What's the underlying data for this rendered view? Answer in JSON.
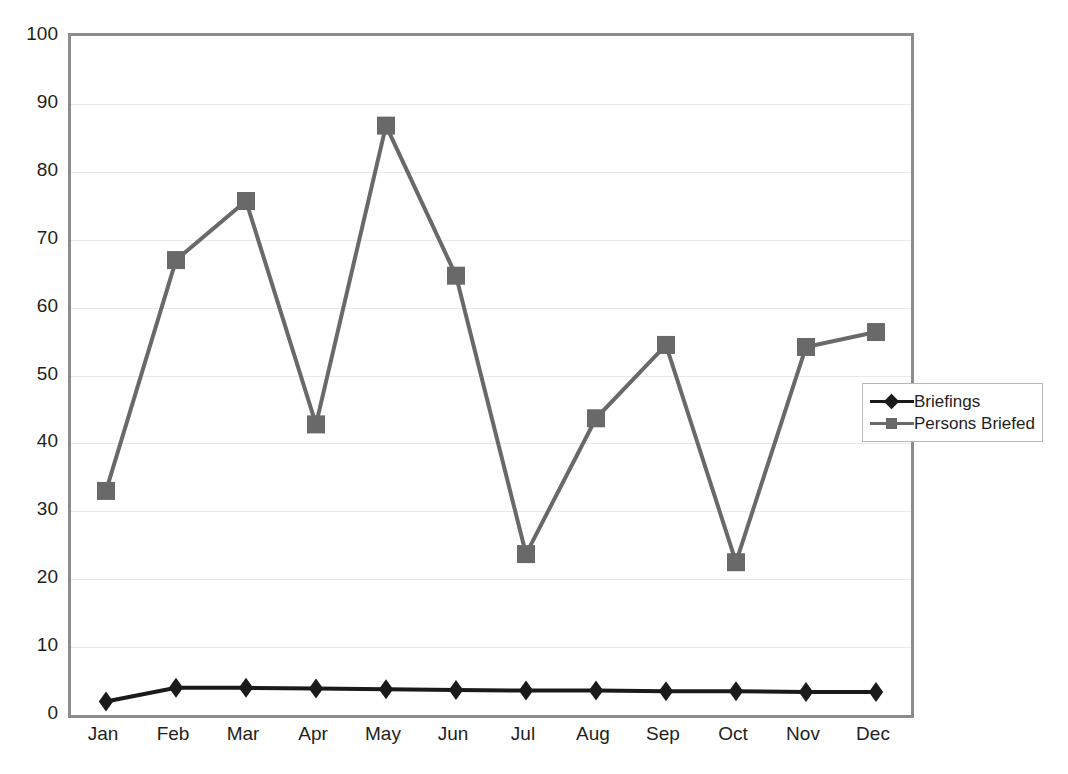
{
  "chart_data": {
    "type": "line",
    "title": "",
    "subtitle": "",
    "xlabel": "",
    "ylabel": "",
    "categories": [
      "Jan",
      "Feb",
      "Mar",
      "Apr",
      "May",
      "Jun",
      "Jul",
      "Aug",
      "Sep",
      "Oct",
      "Nov",
      "Dec"
    ],
    "series": [
      {
        "name": "Briefings",
        "color": "#1a1a1a",
        "marker": "diamond",
        "values": [
          2,
          4,
          4,
          3.9,
          3.8,
          3.7,
          3.6,
          3.6,
          3.5,
          3.5,
          3.4,
          3.4
        ]
      },
      {
        "name": "Persons Briefed",
        "color": "#696969",
        "marker": "square",
        "values": [
          33,
          67,
          75.7,
          42.8,
          86.8,
          64.7,
          23.7,
          43.7,
          54.5,
          22.5,
          54.2,
          56.4
        ]
      }
    ],
    "ylim": [
      0,
      100
    ],
    "ytick_labels": [
      "0",
      "10",
      "20",
      "30",
      "40",
      "50",
      "60",
      "70",
      "80",
      "90",
      "100"
    ],
    "ytick_values": [
      0,
      10,
      20,
      30,
      40,
      50,
      60,
      70,
      80,
      90,
      100
    ],
    "grid": true,
    "grid_axis": "y",
    "legend_position": "right-middle",
    "plot_border_color": "#8c8c8c",
    "gridline_color": "#e9e9e9",
    "background_color": "#ffffff"
  },
  "legend": {
    "entries": [
      {
        "label": "Briefings",
        "color": "#1a1a1a",
        "marker": "diamond"
      },
      {
        "label": "Persons Briefed",
        "color": "#696969",
        "marker": "square"
      }
    ]
  }
}
